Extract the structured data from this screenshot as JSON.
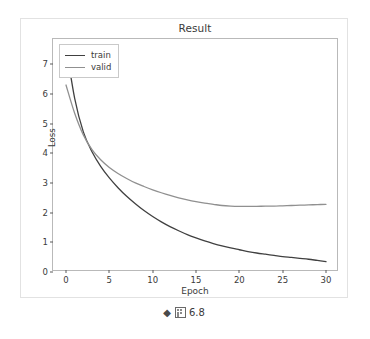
{
  "figure": {
    "caption_marker": "◆",
    "caption_glyph_name": "cjk-box-glyph",
    "caption_number": "6.8"
  },
  "chart_data": {
    "type": "line",
    "title": "Result",
    "xlabel": "Epoch",
    "ylabel": "Loss",
    "xlim": [
      -1.5,
      31.5
    ],
    "ylim": [
      0,
      7.85
    ],
    "xticks": [
      0,
      5,
      10,
      15,
      20,
      25,
      30
    ],
    "yticks": [
      0,
      1,
      2,
      3,
      4,
      5,
      6,
      7
    ],
    "xtick_labels": [
      "0",
      "5",
      "10",
      "15",
      "20",
      "25",
      "30"
    ],
    "ytick_labels": [
      "0",
      "1",
      "2",
      "3",
      "4",
      "5",
      "6",
      "7"
    ],
    "grid": false,
    "legend_position": "upper left",
    "x": [
      0,
      1,
      2,
      3,
      4,
      5,
      6,
      7,
      8,
      9,
      10,
      11,
      12,
      13,
      14,
      15,
      16,
      17,
      18,
      19,
      20,
      21,
      22,
      23,
      24,
      25,
      26,
      27,
      28,
      29,
      30
    ],
    "series": [
      {
        "name": "train",
        "color": "#404040",
        "values": [
          7.62,
          5.85,
          4.72,
          4.05,
          3.56,
          3.17,
          2.84,
          2.55,
          2.3,
          2.07,
          1.87,
          1.69,
          1.53,
          1.39,
          1.26,
          1.15,
          1.05,
          0.96,
          0.88,
          0.81,
          0.75,
          0.69,
          0.64,
          0.6,
          0.56,
          0.52,
          0.49,
          0.46,
          0.43,
          0.39,
          0.35
        ]
      },
      {
        "name": "valid",
        "color": "#909090",
        "values": [
          6.3,
          5.35,
          4.62,
          4.12,
          3.78,
          3.52,
          3.32,
          3.15,
          3.0,
          2.88,
          2.77,
          2.67,
          2.58,
          2.5,
          2.43,
          2.37,
          2.32,
          2.28,
          2.24,
          2.22,
          2.21,
          2.21,
          2.21,
          2.22,
          2.22,
          2.23,
          2.24,
          2.25,
          2.26,
          2.27,
          2.28
        ]
      }
    ]
  },
  "legend": {
    "items": [
      {
        "label": "train"
      },
      {
        "label": "valid"
      }
    ]
  }
}
